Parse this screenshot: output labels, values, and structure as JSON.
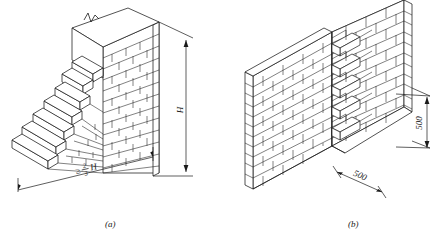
{
  "figure": {
    "type": "engineering-drawing",
    "background_color": "#ffffff",
    "line_color": "#1a1a1a",
    "panels": [
      {
        "id": "a",
        "caption": "(a)",
        "description": "raking toothing / stepped brick wall end",
        "dimensions": [
          {
            "name": "height",
            "label": "H",
            "orientation": "vertical",
            "position": "right"
          },
          {
            "name": "stepped-length",
            "label_symbol": "≥",
            "label_numerator": "2",
            "label_denominator": "3",
            "label_suffix": "H",
            "label_full": "≥ 2/3 H",
            "orientation": "horizontal",
            "position": "bottom"
          }
        ],
        "symbols": [
          {
            "name": "break-line",
            "description": "zigzag break symbol at top of wall"
          }
        ]
      },
      {
        "id": "b",
        "caption": "(b)",
        "description": "toothed / indented masonry joint between two wall leaves",
        "dimensions": [
          {
            "name": "tooth-depth-horizontal",
            "label": "500",
            "orientation": "oblique",
            "position": "bottom"
          },
          {
            "name": "tooth-spacing-vertical",
            "label": "500",
            "orientation": "vertical",
            "position": "right"
          }
        ]
      }
    ]
  }
}
